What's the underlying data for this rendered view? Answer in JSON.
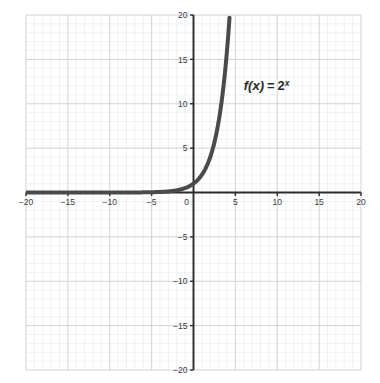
{
  "chart_data": {
    "type": "line",
    "title": "",
    "subtitle": "",
    "xlabel": "",
    "ylabel": "",
    "xlim": [
      -20,
      20
    ],
    "ylim": [
      -20,
      20
    ],
    "grid": true,
    "minor_grid": true,
    "minor_grid_step": 1,
    "major_grid_step": 5,
    "tick_step": 5,
    "legend": "none",
    "annotations": [
      {
        "name": "function-label",
        "text": "f(x) = 2x",
        "text_parts": {
          "fx": "f(x)",
          "equals": "=",
          "base": "2",
          "exponent": "x"
        },
        "x": 6.0,
        "y": 11.5
      }
    ],
    "xticks": [
      -20,
      -15,
      -10,
      -5,
      0,
      5,
      10,
      15,
      20
    ],
    "xtick_labels": [
      "−20",
      "−15",
      "−10",
      "−5",
      "0",
      "5",
      "10",
      "15",
      "20"
    ],
    "yticks": [
      -20,
      -15,
      -10,
      -5,
      5,
      10,
      15,
      20
    ],
    "ytick_labels": [
      "−20",
      "−15",
      "−10",
      "−5",
      "5",
      "10",
      "15",
      "20"
    ],
    "origin_label": "0",
    "series": [
      {
        "name": "f(x) = 2^x",
        "expression": "2^x",
        "color": "#4a4a4a",
        "line_width": 4,
        "x": [
          -20,
          -19,
          -18,
          -17,
          -16,
          -15,
          -14,
          -13,
          -12,
          -11,
          -10,
          -9,
          -8,
          -7,
          -6,
          -5,
          -4,
          -3,
          -2.5,
          -2,
          -1.5,
          -1,
          -0.5,
          0,
          0.5,
          1,
          1.5,
          2,
          2.5,
          3,
          3.25,
          3.5,
          3.75,
          4,
          4.1,
          4.2,
          4.3219
        ],
        "y": [
          1e-06,
          2e-06,
          4e-06,
          8e-06,
          1.53e-05,
          3.05e-05,
          6.1e-05,
          0.000122,
          0.000244,
          0.000488,
          0.000977,
          0.00195,
          0.0039,
          0.0078,
          0.0156,
          0.03125,
          0.0625,
          0.125,
          0.177,
          0.25,
          0.354,
          0.5,
          0.707,
          1,
          1.414,
          2,
          2.828,
          4,
          5.657,
          8,
          9.514,
          11.314,
          13.454,
          16,
          17.148,
          18.379,
          20
        ]
      }
    ]
  },
  "colors": {
    "curve": "#4a4a4a",
    "axis": "#2b2b2b",
    "major_grid": "#c9cdd4",
    "minor_grid": "#e9ebef",
    "tick_text": "#3a3a3a",
    "background": "#ffffff"
  }
}
